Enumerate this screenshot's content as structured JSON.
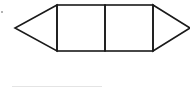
{
  "diagram": {
    "stroke_color": "#1a1a1a",
    "background_color": "#ffffff",
    "shapes": [
      {
        "type": "triangle",
        "name": "left-triangle"
      },
      {
        "type": "square",
        "name": "left-square"
      },
      {
        "type": "square",
        "name": "right-square"
      },
      {
        "type": "triangle",
        "name": "right-triangle"
      }
    ]
  },
  "answer_line": {
    "color": "#e4e4e4"
  }
}
